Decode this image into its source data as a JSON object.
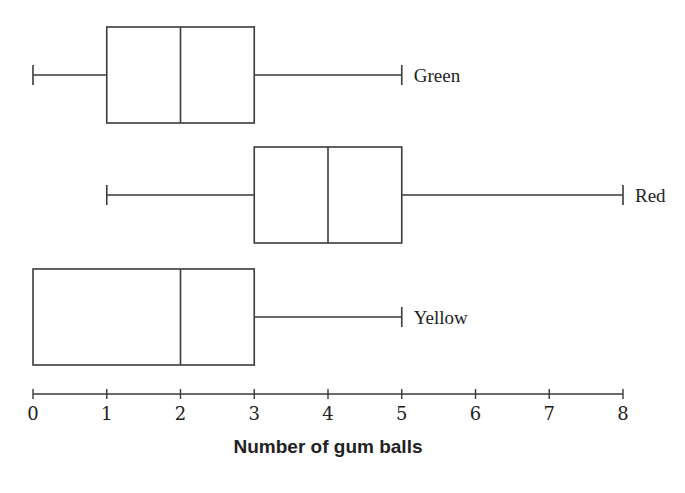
{
  "chart_data": {
    "type": "boxplot",
    "orientation": "horizontal",
    "title": "",
    "xlabel": "Number of gum balls",
    "ylabel": "",
    "xlim": [
      0,
      8
    ],
    "x_ticks": [
      0,
      1,
      2,
      3,
      4,
      5,
      6,
      7,
      8
    ],
    "grid": false,
    "legend": "none (series labeled at right end of each whisker)",
    "series": [
      {
        "name": "Green",
        "min": 0,
        "q1": 1,
        "median": 2,
        "q3": 3,
        "max": 5
      },
      {
        "name": "Red",
        "min": 1,
        "q1": 3,
        "median": 4,
        "q3": 5,
        "max": 8
      },
      {
        "name": "Yellow",
        "min": 0,
        "q1": 0,
        "median": 2,
        "q3": 3,
        "max": 5
      }
    ],
    "colors": {
      "stroke": "#3a3a3a",
      "text": "#222222",
      "background": "#ffffff"
    }
  },
  "layout": {
    "x0_px": 33,
    "unit_px": 73.75,
    "rows": [
      {
        "top": 27,
        "bottom": 123
      },
      {
        "top": 147,
        "bottom": 243
      },
      {
        "top": 269,
        "bottom": 365
      }
    ],
    "axis_y": 394,
    "tick_half": 5,
    "tick_label_y": 420,
    "axis_title_x": 328,
    "axis_title_y": 453,
    "cap_half": 10
  }
}
